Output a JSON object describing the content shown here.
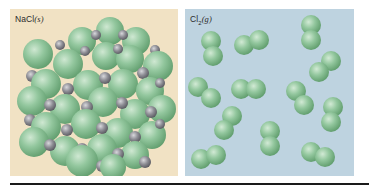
{
  "figure": {
    "panels": [
      {
        "id": "nacl",
        "label_main": "NaCl",
        "label_state": "(s)",
        "description": "Solid sodium chloride crystal lattice: large green chloride spheres alternating with small gray sodium spheres in a cubic arrangement",
        "background": "#f1e2c4",
        "colors": {
          "chloride": "#8fc49a",
          "sodium": "#8d8d94"
        }
      },
      {
        "id": "cl2",
        "label_main": "Cl",
        "label_sub": "2",
        "label_state": "(g)",
        "description": "Gaseous chlorine: 12 separate diatomic Cl2 molecules randomly distributed",
        "background": "#bed3e0",
        "molecule_count": 12,
        "colors": {
          "chlorine": "#8fc49a"
        }
      }
    ]
  }
}
